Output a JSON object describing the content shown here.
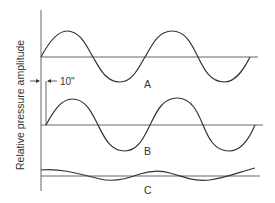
{
  "diagram": {
    "y_axis_label": "Relative pressure amplitude",
    "offset_label": "10\"",
    "waves": [
      {
        "label": "A",
        "amplitude": "large",
        "phase_offset": 0
      },
      {
        "label": "B",
        "amplitude": "large",
        "phase_offset": "10\""
      },
      {
        "label": "C",
        "amplitude": "small",
        "phase_offset": 0
      }
    ],
    "colors": {
      "line": "#333333",
      "axis": "#666666",
      "background": "#ffffff"
    }
  }
}
